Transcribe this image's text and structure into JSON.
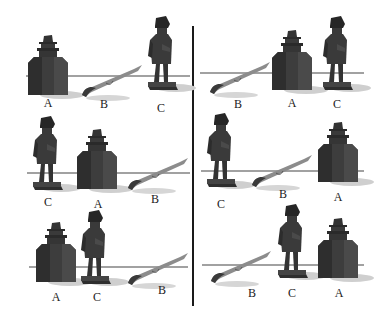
{
  "figure": {
    "objects": {
      "A": "ink-bottle",
      "B": "quill-feather",
      "C": "standing-figurine"
    },
    "colors": {
      "object_dark": "#3a3a3a",
      "object_mid": "#555555",
      "quill": "#8a8a8a",
      "shadow": "#c8c8c8",
      "line": "#444444",
      "divider": "#1a1a1a"
    },
    "panels": [
      {
        "id": "top-left",
        "order": [
          "A",
          "B",
          "C"
        ],
        "labels": [
          {
            "text": "A",
            "x": 48,
            "y": 103
          },
          {
            "text": "B",
            "x": 104,
            "y": 104
          },
          {
            "text": "C",
            "x": 161,
            "y": 108
          }
        ]
      },
      {
        "id": "top-right",
        "order": [
          "B",
          "A",
          "C"
        ],
        "labels": [
          {
            "text": "B",
            "x": 238,
            "y": 104
          },
          {
            "text": "A",
            "x": 292,
            "y": 103
          },
          {
            "text": "C",
            "x": 337,
            "y": 104
          }
        ]
      },
      {
        "id": "middle-left",
        "order": [
          "C",
          "A",
          "B"
        ],
        "labels": [
          {
            "text": "C",
            "x": 48,
            "y": 202
          },
          {
            "text": "A",
            "x": 98,
            "y": 204
          },
          {
            "text": "B",
            "x": 155,
            "y": 199
          }
        ]
      },
      {
        "id": "middle-right",
        "order": [
          "C",
          "B",
          "A"
        ],
        "labels": [
          {
            "text": "C",
            "x": 221,
            "y": 204
          },
          {
            "text": "B",
            "x": 283,
            "y": 194
          },
          {
            "text": "A",
            "x": 338,
            "y": 197
          }
        ]
      },
      {
        "id": "bottom-left",
        "order": [
          "A",
          "C",
          "B"
        ],
        "labels": [
          {
            "text": "A",
            "x": 56,
            "y": 297
          },
          {
            "text": "C",
            "x": 97,
            "y": 297
          },
          {
            "text": "B",
            "x": 162,
            "y": 290
          }
        ]
      },
      {
        "id": "bottom-right",
        "order": [
          "B",
          "C",
          "A"
        ],
        "labels": [
          {
            "text": "B",
            "x": 252,
            "y": 293
          },
          {
            "text": "C",
            "x": 292,
            "y": 293
          },
          {
            "text": "A",
            "x": 339,
            "y": 293
          }
        ]
      }
    ]
  }
}
